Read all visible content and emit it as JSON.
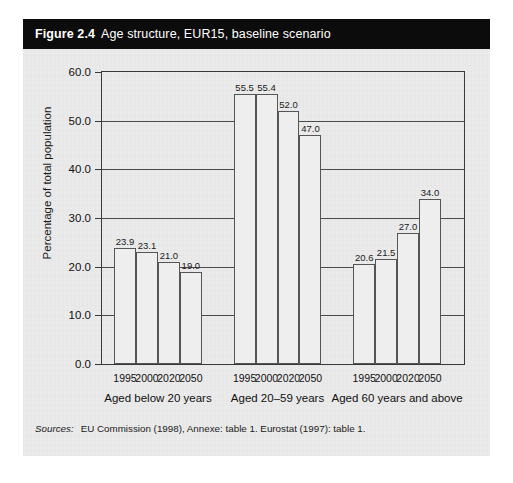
{
  "figure": {
    "number": "Figure 2.4",
    "title": "Age structure, EUR15, baseline scenario",
    "sources_label": "Sources:",
    "sources_text": "EU Commission (1998), Annexe: table 1. Eurostat (1997): table 1."
  },
  "colors": {
    "title_bar_bg": "#0c0c0c",
    "title_bar_text": "#ffffff",
    "figure_bg": "#ebeaea",
    "bar_fill": "#efeeee",
    "bar_border": "#555555",
    "axis": "#3a3a3a",
    "gridline": "#4a4a4a"
  },
  "chart_data": {
    "type": "bar",
    "title": "Age structure, EUR15, baseline scenario",
    "xlabel": "",
    "ylabel": "Percentage of total population",
    "ylim": [
      0.0,
      60.0
    ],
    "ytick_labels": [
      "0.0",
      "10.0",
      "20.0",
      "30.0",
      "40.0",
      "50.0",
      "60.0"
    ],
    "ytick_values": [
      0,
      10,
      20,
      30,
      40,
      50,
      60
    ],
    "grid": "horizontal",
    "legend": "none",
    "categories": [
      "1995",
      "2000",
      "2020",
      "2050"
    ],
    "groups": [
      {
        "label": "Aged below 20 years",
        "values": [
          23.9,
          23.1,
          21.0,
          19.0
        ],
        "value_labels": [
          "23.9",
          "23.1",
          "21.0",
          "19.0"
        ]
      },
      {
        "label": "Aged 20–59 years",
        "values": [
          55.5,
          55.4,
          52.0,
          47.0
        ],
        "value_labels": [
          "55.5",
          "55.4",
          "52.0",
          "47.0"
        ]
      },
      {
        "label": "Aged 60 years and above",
        "values": [
          20.6,
          21.5,
          27.0,
          34.0
        ],
        "value_labels": [
          "20.6",
          "21.5",
          "27.0",
          "34.0"
        ]
      }
    ]
  }
}
